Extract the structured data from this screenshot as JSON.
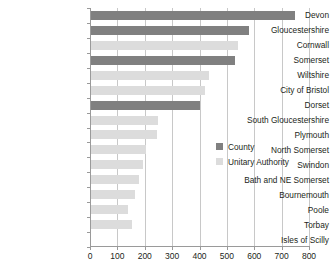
{
  "chart_data": {
    "type": "bar",
    "orientation": "horizontal",
    "title": "",
    "subtitle": "",
    "xlabel": "",
    "ylabel": "",
    "xlim": [
      0,
      800
    ],
    "xticks": [
      0,
      100,
      200,
      300,
      400,
      500,
      600,
      700,
      800
    ],
    "xtick_labels": [
      "0",
      "100",
      "200",
      "300",
      "400",
      "500",
      "600",
      "700",
      "800"
    ],
    "grid": true,
    "grid_axis": "x",
    "legend_position": "middle-right-inside",
    "categories": [
      "Devon",
      "Gloucestershire",
      "Cornwall",
      "Somerset",
      "Wiltshire",
      "City of Bristol",
      "Dorset",
      "South Gloucestershire",
      "Plymouth",
      "North Somerset",
      "Swindon",
      "Bath and NE Somerset",
      "Bournemouth",
      "Poole",
      "Torbay",
      "Isles of Scilly"
    ],
    "values": [
      750,
      580,
      540,
      530,
      435,
      420,
      400,
      250,
      245,
      205,
      195,
      180,
      165,
      140,
      155,
      0
    ],
    "point_types": [
      "County",
      "County",
      "Unitary Authority",
      "County",
      "Unitary Authority",
      "Unitary Authority",
      "County",
      "Unitary Authority",
      "Unitary Authority",
      "Unitary Authority",
      "Unitary Authority",
      "Unitary Authority",
      "Unitary Authority",
      "Unitary Authority",
      "Unitary Authority",
      "Unitary Authority"
    ],
    "series": [
      {
        "name": "County",
        "color": "#808080",
        "points": [
          {
            "category": "Devon",
            "value": 750
          },
          {
            "category": "Gloucestershire",
            "value": 580
          },
          {
            "category": "Somerset",
            "value": 530
          },
          {
            "category": "Dorset",
            "value": 400
          }
        ]
      },
      {
        "name": "Unitary Authority",
        "color": "#dcdcdc",
        "points": [
          {
            "category": "Cornwall",
            "value": 540
          },
          {
            "category": "Wiltshire",
            "value": 435
          },
          {
            "category": "City of Bristol",
            "value": 420
          },
          {
            "category": "South Gloucestershire",
            "value": 250
          },
          {
            "category": "Plymouth",
            "value": 245
          },
          {
            "category": "North Somerset",
            "value": 205
          },
          {
            "category": "Swindon",
            "value": 195
          },
          {
            "category": "Bath and NE Somerset",
            "value": 180
          },
          {
            "category": "Bournemouth",
            "value": 165
          },
          {
            "category": "Poole",
            "value": 140
          },
          {
            "category": "Torbay",
            "value": 155
          },
          {
            "category": "Isles of Scilly",
            "value": 0
          }
        ]
      }
    ]
  },
  "legend": {
    "items": [
      {
        "label": "County",
        "color": "#808080"
      },
      {
        "label": "Unitary Authority",
        "color": "#dcdcdc"
      }
    ]
  },
  "colors": {
    "county": "#808080",
    "unitary_authority": "#dcdcdc",
    "axis": "#9a9a9a",
    "grid": "#c8c8c8",
    "text": "#231f20",
    "background": "#ffffff"
  }
}
